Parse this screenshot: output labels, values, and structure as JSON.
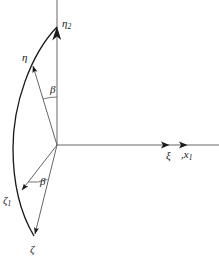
{
  "figure": {
    "background_color": "#ffffff",
    "stroke_color": "#1a1a1a",
    "axis_color": "#3a3a3a",
    "width": 219,
    "height": 265
  },
  "labels": {
    "eta2": "η",
    "eta2_sub": "2",
    "eta": "η",
    "beta_upper": "β",
    "beta_lower": "β",
    "zeta1": "ζ",
    "zeta1_sub": "1",
    "zeta": "ζ",
    "xi": "ξ",
    "xi_sep": ",",
    "x1": "x",
    "x1_sub": "1"
  },
  "geometry": {
    "origin": {
      "x": 57,
      "y": 145
    },
    "vertical_axis": {
      "x": 57,
      "y_top": 0,
      "y_bottom": 145
    },
    "horizontal_axis": {
      "y": 145,
      "x_left": 57,
      "x_right": 219
    },
    "axis_arrow_xi": {
      "x": 168,
      "y": 145
    },
    "axis_arrow_x1": {
      "x": 186,
      "y": 145
    },
    "eta2_arrow_tip": {
      "x": 57,
      "y": 27
    },
    "eta_arrow_tip": {
      "x": 31,
      "y": 64
    },
    "zeta1_arrow_tip": {
      "x": 20,
      "y": 192
    },
    "zeta_arrow_tip": {
      "x": 34,
      "y": 236
    },
    "arc_start": {
      "x": 57,
      "y": 27
    },
    "arc_end": {
      "x": 34,
      "y": 236
    },
    "arc_bulge_x": 13,
    "angle_arc_upper_radius": 46,
    "angle_arc_lower_radius": 38
  },
  "elements": {
    "eta2_axis_name": "eta2-axis-vector",
    "eta_vector_name": "eta-vector",
    "zeta1_vector_name": "zeta1-vector",
    "zeta_vector_name": "zeta-vector",
    "arc_name": "curved-boundary-arc",
    "x_axis_name": "xi-x1-axis"
  }
}
